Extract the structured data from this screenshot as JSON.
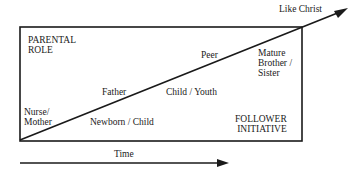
{
  "diagram": {
    "corner_labels": {
      "top_left_line1": "PARENTAL",
      "top_left_line2": "ROLE",
      "bottom_right_line1": "FOLLOWER",
      "bottom_right_line2": "INITIATIVE"
    },
    "above_line": {
      "nurse_line1": "Nurse/",
      "nurse_line2": "Mother",
      "father": "Father",
      "peer": "Peer",
      "mature_line1": "Mature",
      "mature_line2": "Brother /",
      "mature_line3": "Sister"
    },
    "below_line": {
      "newborn": "Newborn / Child",
      "child_youth": "Child / Youth"
    },
    "endpoint_label": "Like Christ",
    "time_axis_label": "Time",
    "colors": {
      "line": "#1a1a1a",
      "background": "#ffffff"
    }
  }
}
